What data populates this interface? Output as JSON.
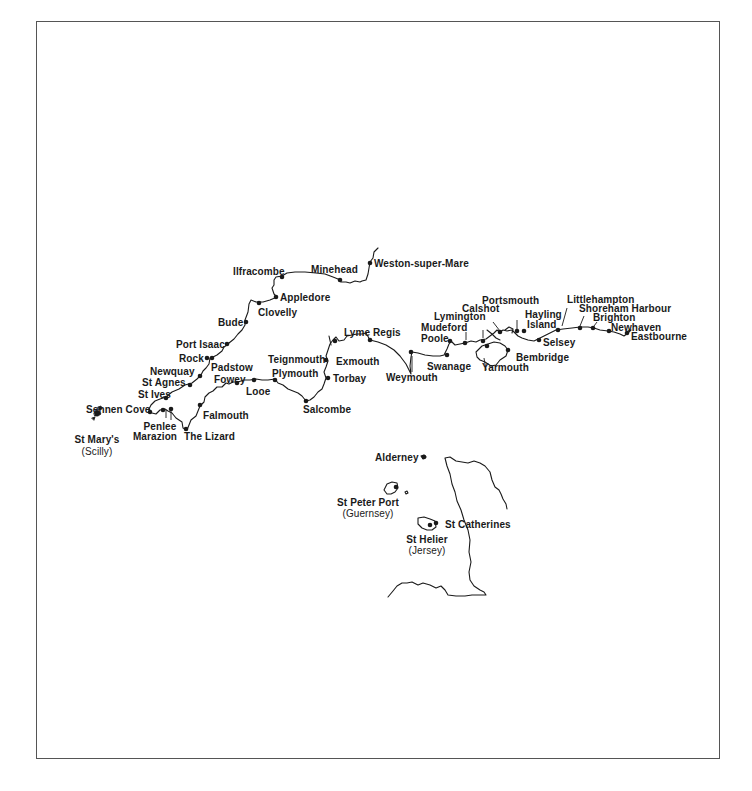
{
  "map": {
    "title": "",
    "places": {
      "weston": "Weston-super-Mare",
      "minehead": "Minehead",
      "ilfracombe": "Ilfracombe",
      "appledore": "Appledore",
      "clovelly": "Clovelly",
      "bude": "Bude",
      "port_isaac": "Port Isaac",
      "rock": "Rock",
      "padstow": "Padstow",
      "newquay": "Newquay",
      "st_agnes": "St Agnes",
      "st_ives": "St Ives",
      "sennen_cove": "Sennen Cove",
      "penlee": "Penlee",
      "marazion": "Marazion",
      "the_lizard": "The Lizard",
      "falmouth": "Falmouth",
      "fowey": "Fowey",
      "looe": "Looe",
      "plymouth": "Plymouth",
      "salcombe": "Salcombe",
      "teignmouth": "Teignmouth",
      "torbay": "Torbay",
      "exmouth": "Exmouth",
      "lyme_regis": "Lyme Regis",
      "weymouth": "Weymouth",
      "swanage": "Swanage",
      "poole": "Poole",
      "mudeford": "Mudeford",
      "lymington": "Lymington",
      "calshot": "Calshot",
      "portsmouth": "Portsmouth",
      "yarmouth": "Yarmouth",
      "bembridge": "Bembridge",
      "hayling_island_1": "Hayling",
      "hayling_island_2": "Island",
      "selsey": "Selsey",
      "littlehampton": "Littlehampton",
      "shoreham_harbour": "Shoreham Harbour",
      "brighton": "Brighton",
      "newhaven": "Newhaven",
      "eastbourne": "Eastbourne",
      "st_marys_1": "St Mary's",
      "st_marys_2": "(Scilly)",
      "alderney": "Alderney",
      "st_peter_port_1": "St Peter Port",
      "st_peter_port_2": "(Guernsey)",
      "st_catherines": "St Catherines",
      "st_helier_1": "St Helier",
      "st_helier_2": "(Jersey)"
    },
    "colors": {
      "ink": "#1a1a1a",
      "frame": "#555555",
      "background": "#ffffff"
    }
  }
}
